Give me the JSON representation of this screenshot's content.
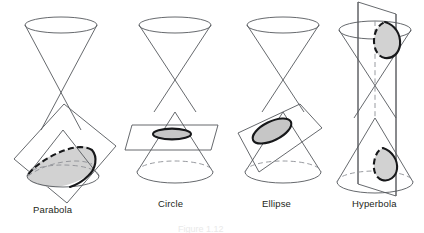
{
  "figure": {
    "caption": "Figure 1.12",
    "panels": [
      {
        "id": "parabola",
        "label": "Parabola",
        "description": "Plane parallel to a generator slicing the lower nappe of a double cone",
        "shaded_region": true,
        "plane_shape": "tilted square"
      },
      {
        "id": "circle",
        "label": "Circle",
        "description": "Horizontal plane perpendicular to the axis slicing the lower nappe",
        "shaded_region": true,
        "plane_shape": "horizontal parallelogram"
      },
      {
        "id": "ellipse",
        "label": "Ellipse",
        "description": "Oblique plane slicing the lower nappe",
        "shaded_region": true,
        "plane_shape": "tilted parallelogram"
      },
      {
        "id": "hyperbola",
        "label": "Hyperbola",
        "description": "Vertical plane parallel to the axis slicing both nappes",
        "shaded_region": true,
        "plane_shape": "vertical rectangle"
      }
    ],
    "colors": {
      "outline": "#55585c",
      "cut_curve": "#17181a",
      "shade_fill": "#d2d2d2",
      "hidden_edge": "#8d9095",
      "label_text": "#231f20",
      "background": "#ffffff"
    }
  }
}
